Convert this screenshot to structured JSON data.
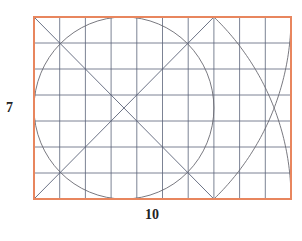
{
  "diagram": {
    "labels": {
      "height": "7",
      "width": "10"
    },
    "units": {
      "width": 10,
      "height": 7
    },
    "frame": {
      "x0": 34,
      "y0": 17,
      "x1": 291,
      "y1": 199
    },
    "colors": {
      "border": "#e8865e",
      "grid": "#5b6378",
      "curve": "#6a6a72",
      "label": "#222222"
    },
    "elements": [
      {
        "type": "rect",
        "name": "outer-rectangle",
        "from": [
          0,
          0
        ],
        "to": [
          10,
          7
        ]
      },
      {
        "type": "grid",
        "name": "unit-grid",
        "cols": 10,
        "rows": 7
      },
      {
        "type": "circle",
        "name": "inscribed-circle",
        "center": [
          3.5,
          3.5
        ],
        "r": 3.5
      },
      {
        "type": "line",
        "name": "diagonal-a",
        "from": [
          0,
          7
        ],
        "to": [
          7,
          0
        ]
      },
      {
        "type": "line",
        "name": "diagonal-b",
        "from": [
          0,
          0
        ],
        "to": [
          7,
          7
        ]
      },
      {
        "type": "arc",
        "name": "arc-top-to-bottom-right",
        "center": [
          0.3333,
          0
        ],
        "r": 9.6667,
        "from": [
          7,
          7
        ],
        "to": [
          10,
          0
        ]
      },
      {
        "type": "arc",
        "name": "arc-bottom-to-top-right",
        "center": [
          0.3333,
          7
        ],
        "r": 9.6667,
        "from": [
          7,
          0
        ],
        "to": [
          10,
          7
        ]
      }
    ]
  }
}
